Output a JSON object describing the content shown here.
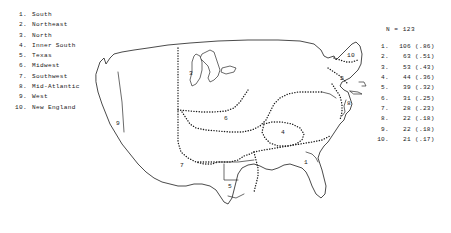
{
  "figure": {
    "type": "choropleth-region-map",
    "sample_size_label": "N = 123"
  },
  "legend": {
    "items": [
      {
        "num": "1.",
        "label": "South"
      },
      {
        "num": "2.",
        "label": "Northeast"
      },
      {
        "num": "3.",
        "label": "North"
      },
      {
        "num": "4.",
        "label": "Inner South"
      },
      {
        "num": "5.",
        "label": "Texas"
      },
      {
        "num": "6.",
        "label": "Midwest"
      },
      {
        "num": "7.",
        "label": "Southwest"
      },
      {
        "num": "8.",
        "label": "Mid-Atlantic"
      },
      {
        "num": "9.",
        "label": "West"
      },
      {
        "num": "10.",
        "label": "New England"
      }
    ]
  },
  "stats": {
    "title": "N = 123",
    "rows": [
      {
        "num": "1.",
        "count": "106",
        "prop": "(.86)"
      },
      {
        "num": "2.",
        "count": "63",
        "prop": "(.51)"
      },
      {
        "num": "3.",
        "count": "53",
        "prop": "(.43)"
      },
      {
        "num": "4.",
        "count": "44",
        "prop": "(.36)"
      },
      {
        "num": "5.",
        "count": "39",
        "prop": "(.32)"
      },
      {
        "num": "6.",
        "count": "31",
        "prop": "(.25)"
      },
      {
        "num": "7.",
        "count": "28",
        "prop": "(.23)"
      },
      {
        "num": "8.",
        "count": "22",
        "prop": "(.18)"
      },
      {
        "num": "9.",
        "count": "22",
        "prop": "(.18)"
      },
      {
        "num": "10.",
        "count": "21",
        "prop": "(.17)"
      }
    ]
  },
  "map": {
    "region_labels": [
      {
        "id": "south",
        "text": "1",
        "x": 228,
        "y": 152
      },
      {
        "id": "northeast",
        "text": "2",
        "x": 264,
        "y": 68
      },
      {
        "id": "north",
        "text": "3",
        "x": 113,
        "y": 63
      },
      {
        "id": "inner-south",
        "text": "4",
        "x": 205,
        "y": 122
      },
      {
        "id": "texas",
        "text": "5",
        "x": 152,
        "y": 176
      },
      {
        "id": "midwest",
        "text": "6",
        "x": 148,
        "y": 108
      },
      {
        "id": "southwest",
        "text": "7",
        "x": 104,
        "y": 155
      },
      {
        "id": "mid-atlantic",
        "text": "8",
        "x": 271,
        "y": 93
      },
      {
        "id": "west",
        "text": "9",
        "x": 40,
        "y": 113
      },
      {
        "id": "new-england",
        "text": "10",
        "x": 273,
        "y": 45
      }
    ]
  }
}
